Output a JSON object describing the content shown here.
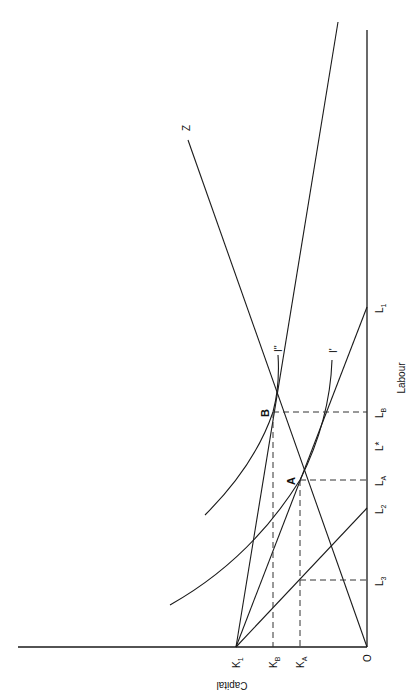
{
  "diagram": {
    "axes": {
      "x_axis_label": "Labour",
      "y_axis_label": "Capital",
      "origin_label": "O"
    },
    "capital_ticks": {
      "k1": "K",
      "k1_sub": "1",
      "kb": "K",
      "kb_sub": "B",
      "ka": "K",
      "ka_sub": "A"
    },
    "labour_ticks": {
      "l3": "L",
      "l3_sub": "3",
      "l2": "L",
      "l2_sub": "2",
      "la": "L",
      "la_sub": "A",
      "lstar": "L*",
      "lb": "L",
      "lb_sub": "B",
      "l1": "L",
      "l1_sub": "1"
    },
    "points": {
      "a": "A",
      "b": "B"
    },
    "curves": {
      "i_prime": "I'",
      "i_double_prime": "I''",
      "z": "Z"
    }
  }
}
